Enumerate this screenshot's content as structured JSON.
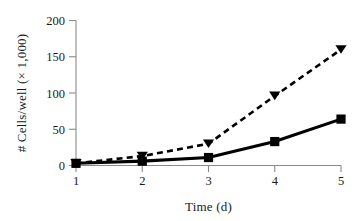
{
  "chart_data": {
    "type": "line",
    "title": "",
    "xlabel": "Time (d)",
    "ylabel": "# Cells/well (× 1,000)",
    "x": [
      1,
      2,
      3,
      4,
      5
    ],
    "xtick_labels": [
      "1",
      "2",
      "3",
      "4",
      "5"
    ],
    "ytick_labels": [
      "0",
      "50",
      "100",
      "150",
      "200"
    ],
    "ytick_values": [
      0,
      50,
      100,
      150,
      200
    ],
    "xlim": [
      1,
      5
    ],
    "ylim": [
      0,
      200
    ],
    "grid": false,
    "legend": "none",
    "series": [
      {
        "name": "solid-square-series",
        "marker": "square",
        "line_style": "solid",
        "color": "#000000",
        "values": [
          3,
          6,
          11,
          33,
          64
        ]
      },
      {
        "name": "dashed-triangle-series",
        "marker": "triangle-down",
        "line_style": "dashed",
        "color": "#000000",
        "values": [
          3,
          13,
          30,
          96,
          160
        ]
      }
    ]
  },
  "axes": {
    "y_axis_label": "# Cells/well (× 1,000)",
    "x_axis_label": "Time (d)",
    "y_ticks": [
      {
        "label": "200",
        "value": 200
      },
      {
        "label": "150",
        "value": 150
      },
      {
        "label": "100",
        "value": 100
      },
      {
        "label": "50",
        "value": 50
      },
      {
        "label": "0",
        "value": 0
      }
    ],
    "x_ticks": [
      {
        "label": "1",
        "value": 1
      },
      {
        "label": "2",
        "value": 2
      },
      {
        "label": "3",
        "value": 3
      },
      {
        "label": "4",
        "value": 4
      },
      {
        "label": "5",
        "value": 5
      }
    ]
  }
}
